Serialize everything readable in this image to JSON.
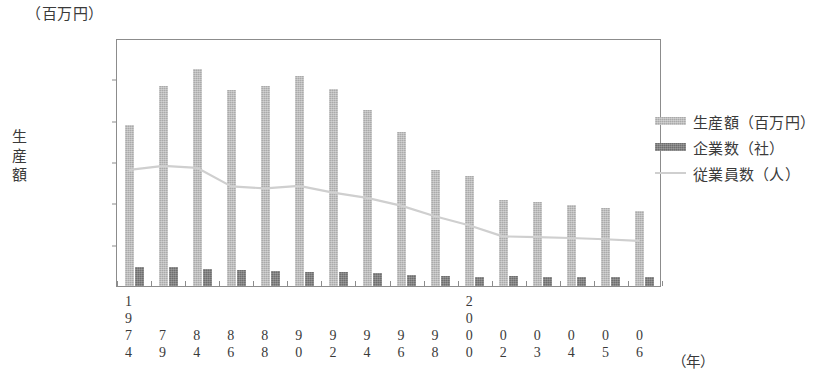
{
  "unit_caption": "（百万円）",
  "yaxis_title_chars": [
    "生",
    "産",
    "額"
  ],
  "xaxis_unit": "（年）",
  "legend": {
    "items": [
      {
        "label": "生産額（百万円）",
        "swatch": "bar-light",
        "color": "#aaaaaa"
      },
      {
        "label": "企業数（社）",
        "swatch": "bar-dark",
        "color": "#6e6e6e"
      },
      {
        "label": "従業員数（人）",
        "swatch": "line",
        "color": "#cfcfcf"
      }
    ]
  },
  "chart_data": {
    "type": "bar",
    "title": "",
    "subtitle": "",
    "xlabel": "（年）",
    "ylabel": "生産額",
    "yunit": "（百万円）",
    "ylim": [
      0,
      600000
    ],
    "ytick_values": [
      0,
      100000,
      200000,
      300000,
      400000,
      500000,
      600000
    ],
    "ytick_labels": [
      "0",
      "100,000",
      "200,000",
      "300,000",
      "400,000",
      "500,000",
      "600,000"
    ],
    "grid": false,
    "legend_position": "right",
    "categories": [
      "1974",
      "1979",
      "1984",
      "1986",
      "1988",
      "1990",
      "1992",
      "1994",
      "1996",
      "1998",
      "2000",
      "2002",
      "2003",
      "2004",
      "2005",
      "2006"
    ],
    "category_label_lines": [
      [
        "1",
        "9",
        "7",
        "4"
      ],
      [
        "",
        "",
        "7",
        "9"
      ],
      [
        "",
        "",
        "8",
        "4"
      ],
      [
        "",
        "",
        "8",
        "6"
      ],
      [
        "",
        "",
        "8",
        "8"
      ],
      [
        "",
        "",
        "9",
        "0"
      ],
      [
        "",
        "",
        "9",
        "2"
      ],
      [
        "",
        "",
        "9",
        "4"
      ],
      [
        "",
        "",
        "9",
        "6"
      ],
      [
        "",
        "",
        "9",
        "8"
      ],
      [
        "2",
        "0",
        "0",
        "0"
      ],
      [
        "",
        "",
        "0",
        "2"
      ],
      [
        "",
        "",
        "0",
        "3"
      ],
      [
        "",
        "",
        "0",
        "4"
      ],
      [
        "",
        "",
        "0",
        "5"
      ],
      [
        "",
        "",
        "0",
        "6"
      ]
    ],
    "series": [
      {
        "name": "生産額（百万円）",
        "type": "bar",
        "color": "#aaaaaa",
        "values": [
          389000,
          484000,
          525000,
          475000,
          483000,
          509000,
          477000,
          425000,
          373000,
          281000,
          266000,
          208000,
          203000,
          196000,
          188000,
          181000
        ]
      },
      {
        "name": "企業数（社）",
        "type": "bar",
        "color": "#6e6e6e",
        "values": [
          47000,
          46000,
          40000,
          38000,
          37000,
          35000,
          33000,
          31000,
          27000,
          25000,
          22000,
          24000,
          23000,
          22000,
          21000,
          21000
        ]
      },
      {
        "name": "従業員数（人）",
        "type": "line",
        "color": "#cfcfcf",
        "values": [
          283000,
          293000,
          288000,
          243000,
          238000,
          244000,
          228000,
          215000,
          196000,
          170000,
          148000,
          121000,
          119000,
          117000,
          114000,
          110000
        ]
      }
    ]
  }
}
